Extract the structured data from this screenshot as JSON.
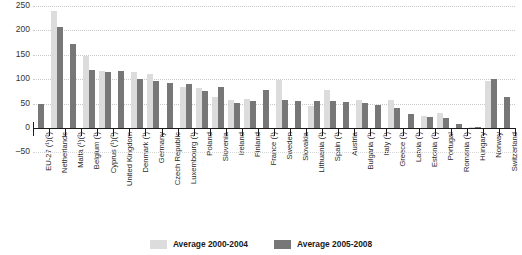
{
  "chart_data": {
    "type": "bar",
    "title": "",
    "xlabel": "",
    "ylabel": "",
    "ylim": [
      -50,
      250
    ],
    "yticks": [
      -50,
      0,
      50,
      100,
      150,
      200,
      250
    ],
    "grid": true,
    "legend_position": "bottom",
    "categories": [
      "EU-27 (¹)(²)",
      "Netherlands",
      "Malta (¹)(²)",
      "Belgium (¹)",
      "Cyprus (¹)(²)",
      "United Kingdom",
      "Denmark (¹)",
      "Germany",
      "Czech Republic",
      "Luxembourg (¹)",
      "Poland",
      "Slovenia",
      "Ireland",
      "Finland",
      "France (¹)",
      "Sweden",
      "Slovakia",
      "Lithuania (¹)",
      "Spain (¹)",
      "Austria",
      "Bulgaria (¹)",
      "Italy (¹)",
      "Greece (¹)",
      "Latvia (¹)",
      "Estonia (¹)",
      "Portugal",
      "Romania (¹)",
      "Hungary",
      "Norway",
      "Switzerland"
    ],
    "series": [
      {
        "name": "Average 2000-2004",
        "color": "#dcdcdc",
        "values": [
          null,
          240,
          null,
          148,
          117,
          null,
          114,
          111,
          null,
          85,
          81,
          63,
          57,
          60,
          null,
          98,
          null,
          45,
          78,
          null,
          58,
          null,
          57,
          null,
          25,
          30,
          null,
          3,
          97,
          null
        ]
      },
      {
        "name": "Average 2005-2008",
        "color": "#777777",
        "values": [
          50,
          208,
          172,
          118,
          115,
          116,
          101,
          96,
          92,
          91,
          75,
          84,
          52,
          56,
          77,
          57,
          56,
          56,
          56,
          53,
          52,
          48,
          40,
          29,
          22,
          20,
          8,
          1,
          100,
          63
        ]
      }
    ]
  },
  "legend": {
    "items": [
      {
        "label": "Average 2000-2004",
        "color": "#dcdcdc"
      },
      {
        "label": "Average 2005-2008",
        "color": "#777777"
      }
    ]
  }
}
